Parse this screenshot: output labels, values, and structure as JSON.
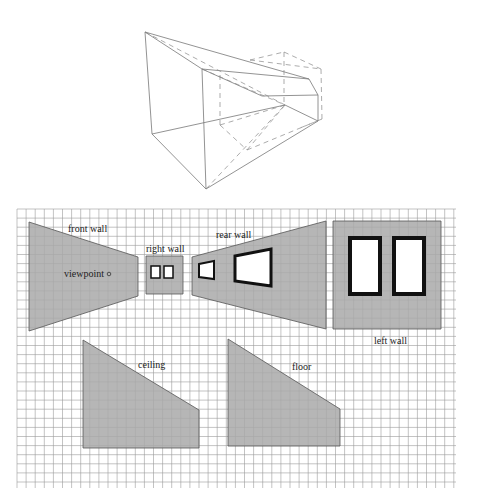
{
  "figure": {
    "wireframe": {
      "solid_edges": [
        [
          145,
          32,
          202,
          69
        ],
        [
          145,
          32,
          309,
          79
        ],
        [
          145,
          32,
          152,
          134
        ],
        [
          202,
          69,
          206,
          189
        ],
        [
          152,
          134,
          206,
          189
        ],
        [
          202,
          69,
          309,
          79
        ],
        [
          202,
          69,
          262,
          96
        ],
        [
          262,
          96,
          318,
          95
        ],
        [
          318,
          95,
          318,
          121
        ],
        [
          152,
          134,
          285,
          105
        ],
        [
          206,
          189,
          318,
          121
        ],
        [
          285,
          105,
          318,
          121
        ],
        [
          309,
          79,
          318,
          95
        ]
      ],
      "dashed_edges": [
        [
          145,
          32,
          285,
          105
        ],
        [
          202,
          69,
          285,
          105
        ],
        [
          284,
          52,
          321,
          69
        ],
        [
          284,
          52,
          284,
          105
        ],
        [
          321,
          69,
          322,
          119
        ],
        [
          322,
          119,
          300,
          128
        ],
        [
          220,
          75,
          220,
          125
        ],
        [
          220,
          125,
          285,
          105
        ],
        [
          220,
          125,
          247,
          150
        ],
        [
          247,
          150,
          285,
          105
        ],
        [
          247,
          150,
          322,
          119
        ],
        [
          206,
          189,
          285,
          105
        ],
        [
          250,
          60,
          284,
          52
        ],
        [
          250,
          60,
          321,
          69
        ]
      ]
    },
    "grid": {
      "x0": 17,
      "y0": 209,
      "x1": 456,
      "y1": 488,
      "step": 9.1,
      "color": "#9a9a9a"
    },
    "fill_color": "#a9a9a9",
    "stroke_color": "#555555",
    "panels": {
      "front_wall": {
        "label": "front wall",
        "points": "29,222 138,257 138,296 29,331",
        "label_x": 68,
        "label_y": 232
      },
      "right_wall": {
        "label": "right wall",
        "points": "146,256 183,256 183,294 146,294",
        "label_x": 146,
        "label_y": 252
      },
      "rear_wall": {
        "label": "rear wall",
        "points": "192,257 326,221 326,329 192,295",
        "label_x": 216,
        "label_y": 238
      },
      "left_wall": {
        "label": "left wall",
        "points": "333,221 441,221 441,329 333,329",
        "label_x": 374,
        "label_y": 344
      },
      "ceiling": {
        "label": "ceiling",
        "points": "83,340 199,410 199,448 83,448",
        "label_x": 138,
        "label_y": 368
      },
      "floor": {
        "label": "floor",
        "points": "228,339 340,409 340,446 228,446",
        "label_x": 292,
        "label_y": 370
      }
    },
    "viewpoint": {
      "label": "viewpoint",
      "x": 64,
      "y": 277,
      "circle_x": 109,
      "circle_y": 274
    },
    "windows": {
      "right_wall": [
        {
          "points": "151,266 160,266 160,278 151,278",
          "stroke": 1.5
        },
        {
          "points": "164,266 173,266 173,278 164,278",
          "stroke": 1.5
        }
      ],
      "rear_wall": [
        {
          "points": "199,264 214,261 214,279 199,277",
          "stroke": 2
        },
        {
          "points": "235,256 271,249 271,286 235,281",
          "stroke": 3
        }
      ],
      "left_wall": [
        {
          "points": "350,238 380,238 380,294 350,294",
          "stroke": 4
        },
        {
          "points": "394,238 424,238 424,294 394,294",
          "stroke": 4
        }
      ]
    }
  }
}
